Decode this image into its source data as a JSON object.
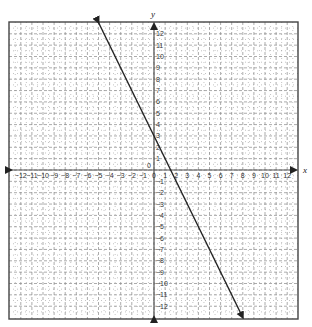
{
  "chart_data": {
    "type": "line",
    "title": "",
    "xlabel": "x",
    "ylabel": "y",
    "xlim": [
      -12,
      12
    ],
    "ylim": [
      -12,
      12
    ],
    "grid": true,
    "x_ticks": [
      -12,
      -11,
      -10,
      -9,
      -8,
      -7,
      -6,
      -5,
      -4,
      -3,
      -2,
      -1,
      0,
      1,
      2,
      3,
      4,
      5,
      6,
      7,
      8,
      9,
      10,
      11,
      12
    ],
    "y_ticks": [
      -12,
      -11,
      -10,
      -9,
      -8,
      -7,
      -6,
      -5,
      -4,
      -3,
      -2,
      -1,
      0,
      1,
      2,
      3,
      4,
      5,
      6,
      7,
      8,
      9,
      10,
      11,
      12
    ],
    "series": [
      {
        "name": "line",
        "equation": "y = -2x + 3",
        "slope": -2,
        "intercept": 3,
        "x": [
          -5,
          8
        ],
        "y": [
          13,
          -13
        ],
        "arrows": "both"
      }
    ]
  },
  "colors": {
    "line": "#222222",
    "grid": "#888888",
    "axis": "#555555"
  }
}
